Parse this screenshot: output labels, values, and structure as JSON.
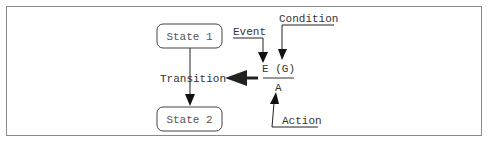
{
  "diagram": {
    "states": [
      {
        "label": "State 1"
      },
      {
        "label": "State 2"
      }
    ],
    "transition_label": "Transition",
    "notation": {
      "event_guard": "E (G)",
      "action": "A"
    },
    "annotations": {
      "event": "Event",
      "condition": "Condition",
      "action": "Action"
    }
  }
}
